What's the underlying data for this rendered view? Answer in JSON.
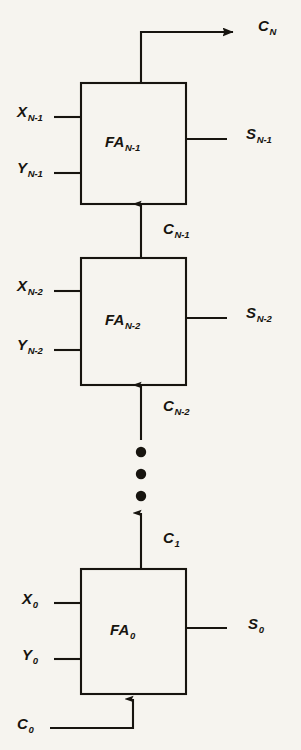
{
  "figure": {
    "type": "block-diagram",
    "background_color": "#f6f4ef",
    "line_color": "#17140f",
    "text_color": "#17140f"
  },
  "blocks": [
    {
      "id": "fa-n-1",
      "label_base": "FA",
      "label_sub": "N-1",
      "inputs": [
        {
          "name": "X",
          "base": "X",
          "sub": "N-1"
        },
        {
          "name": "Y",
          "base": "Y",
          "sub": "N-1"
        }
      ],
      "sum_output": {
        "base": "S",
        "sub": "N-1"
      },
      "carry_out": {
        "base": "C",
        "sub": "N"
      },
      "carry_in": {
        "base": "C",
        "sub": "N-1"
      }
    },
    {
      "id": "fa-n-2",
      "label_base": "FA",
      "label_sub": "N-2",
      "inputs": [
        {
          "name": "X",
          "base": "X",
          "sub": "N-2"
        },
        {
          "name": "Y",
          "base": "Y",
          "sub": "N-2"
        }
      ],
      "sum_output": {
        "base": "S",
        "sub": "N-2"
      },
      "carry_out": {
        "base": "C",
        "sub": "N-1"
      },
      "carry_in": {
        "base": "C",
        "sub": "N-2"
      }
    },
    {
      "id": "fa-0",
      "label_base": "FA",
      "label_sub": "0",
      "inputs": [
        {
          "name": "X",
          "base": "X",
          "sub": "0"
        },
        {
          "name": "Y",
          "base": "Y",
          "sub": "0"
        }
      ],
      "sum_output": {
        "base": "S",
        "sub": "0"
      },
      "carry_out": {
        "base": "C",
        "sub": "1"
      },
      "carry_in": {
        "base": "C",
        "sub": "0"
      }
    }
  ],
  "labels": {
    "carry_out_top": {
      "base": "C",
      "sub": "N"
    },
    "block1_name": {
      "base": "FA",
      "sub": "N-1"
    },
    "block1_x": {
      "base": "X",
      "sub": "N-1"
    },
    "block1_y": {
      "base": "Y",
      "sub": "N-1"
    },
    "block1_s": {
      "base": "S",
      "sub": "N-1"
    },
    "carry_n_minus_1": {
      "base": "C",
      "sub": "N-1"
    },
    "block2_name": {
      "base": "FA",
      "sub": "N-2"
    },
    "block2_x": {
      "base": "X",
      "sub": "N-2"
    },
    "block2_y": {
      "base": "Y",
      "sub": "N-2"
    },
    "block2_s": {
      "base": "S",
      "sub": "N-2"
    },
    "carry_n_minus_2": {
      "base": "C",
      "sub": "N-2"
    },
    "carry_1": {
      "base": "C",
      "sub": "1"
    },
    "block3_name": {
      "base": "FA",
      "sub": "0"
    },
    "block3_x": {
      "base": "X",
      "sub": "0"
    },
    "block3_y": {
      "base": "Y",
      "sub": "0"
    },
    "block3_s": {
      "base": "S",
      "sub": "0"
    },
    "carry_0": {
      "base": "C",
      "sub": "0"
    }
  },
  "ellipsis": {
    "dot_count": 3,
    "meaning": "additional full adder stages omitted"
  }
}
